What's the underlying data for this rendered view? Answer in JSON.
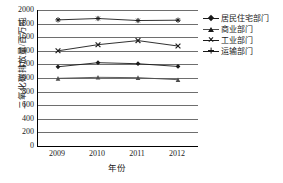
{
  "chart_data": {
    "type": "line",
    "title": "",
    "xlabel": "年份",
    "ylabel": "二氧化碳排放量/百万吨",
    "categories": [
      "2009",
      "2010",
      "2011",
      "2012"
    ],
    "x": [
      2009,
      2010,
      2011,
      2012
    ],
    "ylim": [
      0,
      2000
    ],
    "ytick_values": [
      0,
      200,
      400,
      600,
      800,
      1000,
      1200,
      1400,
      1600,
      1800,
      2000
    ],
    "ytick_labels": [
      "0",
      "200",
      "400",
      "600",
      "800",
      "1000",
      "1200",
      "1400",
      "1600",
      "1800",
      "2000"
    ],
    "grid": true,
    "grid_axis": "y",
    "legend_position": "right",
    "series": [
      {
        "name": "居民住宅部门",
        "marker": "diamond",
        "color": "#1a1a1a",
        "values": [
          1165,
          1225,
          1210,
          1170
        ]
      },
      {
        "name": "商业部门",
        "marker": "triangle",
        "color": "#4d4d4d",
        "values": [
          995,
          1010,
          1005,
          975
        ]
      },
      {
        "name": "工业部门",
        "marker": "cross",
        "color": "#1a1a1a",
        "values": [
          1400,
          1490,
          1550,
          1470
        ]
      },
      {
        "name": "运输部门",
        "marker": "star",
        "color": "#1a1a1a",
        "values": [
          1855,
          1875,
          1845,
          1850
        ]
      }
    ]
  },
  "axes": {
    "y_title": "二氧化碳排放量/百万吨",
    "x_title": "年份"
  },
  "legend": {
    "items": [
      {
        "label": "居民住宅部门"
      },
      {
        "label": "商业部门"
      },
      {
        "label": "工业部门"
      },
      {
        "label": "运输部门"
      }
    ]
  },
  "colors": {
    "axis": "#000000",
    "grid": "#6e6e6e",
    "ink": "#1a1a1a",
    "background": "#ffffff"
  }
}
